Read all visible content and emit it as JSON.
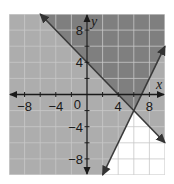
{
  "chart_data": {
    "type": "inequality-graph",
    "title": "",
    "xlabel": "x",
    "ylabel": "y",
    "xlim": [
      -10,
      10
    ],
    "ylim": [
      -10,
      10
    ],
    "grid": true,
    "grid_step": 2,
    "x_tick_labels": [
      {
        "value": -8,
        "label": "−8"
      },
      {
        "value": -4,
        "label": "−4"
      },
      {
        "value": 4,
        "label": "4"
      },
      {
        "value": 8,
        "label": "8"
      }
    ],
    "y_tick_labels": [
      {
        "value": 8,
        "label": "8"
      },
      {
        "value": 4,
        "label": "4"
      },
      {
        "value": -4,
        "label": "−4"
      },
      {
        "value": -8,
        "label": "−8"
      }
    ],
    "origin_label": "0",
    "lines": [
      {
        "name": "line-1",
        "equation": "y = -x + 4",
        "slope": -1,
        "intercept": 4,
        "from": [
          -6,
          10
        ],
        "to": [
          10,
          -6
        ],
        "style": "solid"
      },
      {
        "name": "line-2",
        "equation": "y = 2x - 14",
        "slope": 2,
        "intercept": -14,
        "from": [
          2,
          -10
        ],
        "to": [
          10,
          6
        ],
        "style": "solid"
      }
    ],
    "intersection": [
      6,
      -2
    ],
    "regions": [
      {
        "name": "overlap",
        "description": "y >= -x + 4 and y >= 2x - 14",
        "shade": "dark"
      },
      {
        "name": "single",
        "description": "satisfies exactly one inequality",
        "shade": "light"
      },
      {
        "name": "neither",
        "description": "y < -x + 4 and y < 2x - 14",
        "shade": "none"
      }
    ]
  },
  "colors": {
    "dark_shade": "#7f7f7f",
    "light_shade": "#adadad",
    "unshaded": "#ffffff",
    "grid": "#c8c8c8",
    "grid_on_white": "#d0d0d0",
    "axis": "#1a1a1a",
    "line": "#3a3a3a"
  }
}
